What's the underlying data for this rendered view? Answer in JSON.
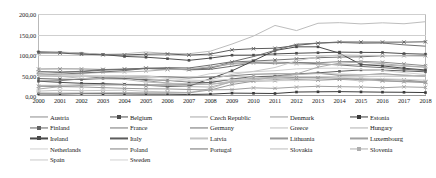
{
  "chart_data": {
    "type": "line",
    "title": "",
    "subtitle": "",
    "xlabel": "",
    "ylabel": "",
    "grid": true,
    "legend_position": "bottom",
    "legend_columns": 5,
    "ylim": [
      0,
      200
    ],
    "yticks": [
      "0,00",
      "50,00",
      "100,00",
      "150,00",
      "200,00"
    ],
    "ytick_values": [
      0,
      50,
      100,
      150,
      200
    ],
    "x": [
      2000,
      2001,
      2002,
      2003,
      2004,
      2005,
      2006,
      2007,
      2008,
      2009,
      2010,
      2011,
      2012,
      2013,
      2014,
      2015,
      2016,
      2017,
      2018
    ],
    "xticks": [
      "2000",
      "2001",
      "2002",
      "2003",
      "2004",
      "2005",
      "2006",
      "2007",
      "2008",
      "2009",
      "2010",
      "2011",
      "2012",
      "2013",
      "2014",
      "2015",
      "2016",
      "2017",
      "2018"
    ],
    "series": [
      {
        "name": "Austria",
        "color": "#8c8c8c",
        "marker": "cross",
        "values": [
          65.8,
          66.2,
          66.0,
          64.8,
          64.5,
          68.2,
          66.8,
          64.6,
          68.4,
          79.4,
          82.4,
          82.2,
          81.7,
          81.0,
          83.8,
          84.3,
          82.5,
          78.3,
          74.0
        ]
      },
      {
        "name": "Belgium",
        "color": "#4d4d4d",
        "marker": "square",
        "values": [
          107.6,
          106.6,
          104.3,
          101.1,
          96.5,
          94.6,
          91.0,
          87.0,
          92.5,
          99.5,
          99.7,
          102.6,
          104.3,
          105.5,
          107.0,
          106.4,
          106.1,
          103.4,
          102.0
        ]
      },
      {
        "name": "Czech Republic",
        "color": "#a8a8a8",
        "marker": "cross",
        "values": [
          17.0,
          22.8,
          25.9,
          28.1,
          28.5,
          27.9,
          27.7,
          27.5,
          28.7,
          33.6,
          37.4,
          39.8,
          44.5,
          44.9,
          42.2,
          40.0,
          36.8,
          34.7,
          32.6
        ]
      },
      {
        "name": "Denmark",
        "color": "#9a9a9a",
        "marker": "cross",
        "values": [
          52.4,
          48.5,
          49.1,
          46.2,
          44.2,
          37.4,
          31.5,
          27.3,
          33.3,
          40.2,
          42.6,
          46.1,
          44.9,
          44.0,
          44.3,
          39.8,
          37.2,
          35.5,
          34.1
        ]
      },
      {
        "name": "Estonia",
        "color": "#3a3a3a",
        "marker": "square",
        "values": [
          5.1,
          4.8,
          5.7,
          5.6,
          5.1,
          4.5,
          4.4,
          3.7,
          4.5,
          7.0,
          6.6,
          6.1,
          9.7,
          10.2,
          10.6,
          10.0,
          9.4,
          9.1,
          8.4
        ]
      },
      {
        "name": "Finland",
        "color": "#636363",
        "marker": "square",
        "values": [
          42.5,
          41.0,
          40.2,
          42.8,
          42.7,
          40.0,
          38.2,
          34.0,
          32.7,
          41.7,
          47.1,
          48.5,
          53.9,
          56.5,
          60.2,
          63.6,
          63.0,
          61.3,
          59.0
        ]
      },
      {
        "name": "France",
        "color": "#757575",
        "marker": "cross",
        "values": [
          58.9,
          58.3,
          60.3,
          64.4,
          65.9,
          67.4,
          64.6,
          64.5,
          68.8,
          83.0,
          85.3,
          87.8,
          90.6,
          93.4,
          94.9,
          95.6,
          98.0,
          98.4,
          98.4
        ]
      },
      {
        "name": "Germany",
        "color": "#6e6e6e",
        "marker": "none",
        "values": [
          59.3,
          57.7,
          59.4,
          63.1,
          64.8,
          67.0,
          66.5,
          63.7,
          65.2,
          72.6,
          81.0,
          78.7,
          81.1,
          78.7,
          75.7,
          72.1,
          69.2,
          65.3,
          61.9
        ]
      },
      {
        "name": "Greece",
        "color": "#bdbdbd",
        "marker": "none",
        "values": [
          104.9,
          107.1,
          104.9,
          101.5,
          102.9,
          107.4,
          103.6,
          103.1,
          109.4,
          126.7,
          146.2,
          172.1,
          159.6,
          177.4,
          178.9,
          175.9,
          178.5,
          176.2,
          181.2
        ]
      },
      {
        "name": "Hungary",
        "color": "#b0b0b0",
        "marker": "cross",
        "values": [
          55.3,
          51.9,
          55.0,
          57.6,
          58.5,
          60.5,
          64.5,
          65.5,
          71.6,
          77.8,
          80.2,
          80.5,
          78.4,
          77.2,
          76.6,
          76.7,
          75.5,
          72.9,
          70.2
        ]
      },
      {
        "name": "Ireland",
        "color": "#4a4a4a",
        "marker": "square",
        "values": [
          36.1,
          33.2,
          31.0,
          30.1,
          28.2,
          26.1,
          23.6,
          23.9,
          42.4,
          61.5,
          86.0,
          110.9,
          119.9,
          119.9,
          104.4,
          76.7,
          73.5,
          67.7,
          63.6
        ]
      },
      {
        "name": "Italy",
        "color": "#5c5c5c",
        "marker": "cross",
        "values": [
          105.1,
          104.7,
          101.9,
          100.5,
          100.1,
          101.9,
          102.6,
          99.8,
          102.4,
          112.5,
          115.4,
          116.5,
          123.4,
          129.0,
          131.8,
          131.6,
          131.4,
          131.4,
          132.2
        ]
      },
      {
        "name": "Latvia",
        "color": "#c4c4c4",
        "marker": "cross",
        "values": [
          12.1,
          13.9,
          13.0,
          13.6,
          14.3,
          11.4,
          9.9,
          8.4,
          18.2,
          35.8,
          46.8,
          42.7,
          41.2,
          39.0,
          40.9,
          36.7,
          40.2,
          38.6,
          35.9
        ]
      },
      {
        "name": "Lithuania",
        "color": "#989898",
        "marker": "cross",
        "values": [
          23.5,
          22.9,
          22.1,
          20.4,
          18.7,
          17.6,
          17.2,
          15.9,
          14.6,
          28.0,
          36.2,
          37.2,
          39.8,
          38.8,
          40.5,
          42.6,
          39.9,
          39.3,
          33.8
        ]
      },
      {
        "name": "Luxembourg",
        "color": "#a0a0a0",
        "marker": "cross",
        "values": [
          7.2,
          7.0,
          7.0,
          7.4,
          7.8,
          7.7,
          7.8,
          7.7,
          14.9,
          15.7,
          19.8,
          18.7,
          21.8,
          23.7,
          22.7,
          22.0,
          20.1,
          22.3,
          21.0
        ]
      },
      {
        "name": "Netherlands",
        "color": "#cfcfcf",
        "marker": "none",
        "values": [
          52.1,
          48.7,
          48.2,
          49.3,
          50.0,
          49.8,
          45.2,
          43.0,
          54.7,
          56.8,
          59.3,
          61.7,
          66.2,
          67.7,
          67.9,
          64.6,
          61.9,
          56.9,
          52.4
        ]
      },
      {
        "name": "Poland",
        "color": "#808080",
        "marker": "none",
        "values": [
          36.5,
          37.3,
          41.8,
          46.6,
          45.3,
          46.4,
          46.9,
          44.2,
          46.3,
          49.4,
          53.1,
          54.1,
          53.7,
          55.7,
          50.4,
          51.3,
          54.2,
          50.6,
          48.9
        ]
      },
      {
        "name": "Portugal",
        "color": "#707070",
        "marker": "none",
        "values": [
          50.3,
          53.4,
          56.2,
          58.7,
          62.0,
          67.4,
          69.2,
          68.4,
          75.6,
          83.6,
          96.2,
          111.4,
          126.2,
          129.0,
          130.6,
          128.8,
          129.2,
          124.8,
          121.5
        ]
      },
      {
        "name": "Slovakia",
        "color": "#bbbbbb",
        "marker": "none",
        "values": [
          49.6,
          48.3,
          42.9,
          41.6,
          40.6,
          34.1,
          31.0,
          30.1,
          28.5,
          36.3,
          41.2,
          43.7,
          52.2,
          54.7,
          53.5,
          52.2,
          51.8,
          50.9,
          48.9
        ]
      },
      {
        "name": "Slovenia",
        "color": "#aeaeae",
        "marker": "sq-small",
        "values": [
          25.9,
          26.1,
          27.3,
          26.7,
          26.8,
          26.3,
          26.0,
          22.8,
          21.8,
          34.6,
          38.4,
          46.6,
          53.8,
          70.4,
          80.3,
          82.6,
          78.7,
          74.1,
          70.4
        ]
      },
      {
        "name": "Spain",
        "color": "#c8c8c8",
        "marker": "none",
        "values": [
          58.0,
          54.2,
          51.3,
          47.6,
          45.3,
          42.3,
          38.9,
          35.6,
          39.7,
          52.8,
          60.1,
          69.5,
          85.7,
          95.5,
          100.4,
          99.3,
          99.0,
          98.1,
          97.1
        ]
      },
      {
        "name": "Sweden",
        "color": "#d2d2d2",
        "marker": "none",
        "values": [
          50.9,
          51.3,
          49.3,
          48.7,
          48.9,
          48.9,
          43.1,
          38.9,
          37.4,
          41.0,
          38.3,
          37.5,
          37.7,
          40.5,
          45.2,
          43.9,
          42.3,
          40.7,
          38.8
        ]
      }
    ]
  },
  "legend": {
    "rows": [
      [
        "Austria",
        "Belgium",
        "Czech Republic",
        "Denmark",
        "Estonia"
      ],
      [
        "Finland",
        "France",
        "Germany",
        "Greece",
        "Hungary"
      ],
      [
        "Ireland",
        "Italy",
        "Latvia",
        "Lithuania",
        "Luxembourg"
      ],
      [
        "Netherlands",
        "Poland",
        "Portugal",
        "Slovakia",
        "Slovenia"
      ],
      [
        "Spain",
        "Sweden"
      ]
    ]
  }
}
